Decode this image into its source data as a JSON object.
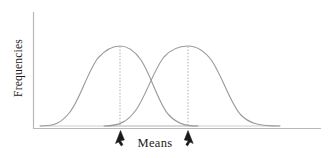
{
  "figure": {
    "title": "",
    "background_color": "#ffffff",
    "line_color": "#9a9a9a",
    "axis_color": "#b8b8b8",
    "text_color": "#1a1a1a",
    "arrow_color": "#1a1a1a"
  },
  "labels": {
    "y_axis": "Frequencies",
    "x_axis": "Means"
  },
  "chart_data": {
    "type": "line",
    "title": "",
    "xlabel": "Means",
    "ylabel": "Frequencies",
    "grid": false,
    "legend": false,
    "axis_ticks": [],
    "xlim": [
      0,
      1
    ],
    "ylim": [
      0,
      1
    ],
    "annotations": [
      {
        "kind": "dashed-vline",
        "at_series": "Distribution 1",
        "label": "mean 1"
      },
      {
        "kind": "dashed-vline",
        "at_series": "Distribution 2",
        "label": "mean 2"
      },
      {
        "kind": "arrow-up",
        "points_to": "mean 1"
      },
      {
        "kind": "arrow-up",
        "points_to": "mean 2"
      }
    ],
    "series": [
      {
        "name": "Distribution 1",
        "kind": "normal-curve",
        "mean": 0.305,
        "peak_height": 0.79,
        "path": "M 40,126 C 56,126 62,122 70,112 C 80,99 88,71 98,58 C 106,49 114,46 120,46 C 127,46 134,50 141,60 C 151,75 158,102 168,114 C 176,123 184,126 198,126"
      },
      {
        "name": "Distribution 2",
        "kind": "normal-curve",
        "mean": 0.545,
        "peak_height": 0.79,
        "path": "M 104,126 C 120,126 128,121 136,110 C 146,96 154,69 164,57 C 172,48 180,46 188,46 C 196,46 204,50 212,61 C 222,76 230,102 240,114 C 249,124 260,126 280,126"
      }
    ],
    "baselines": [
      {
        "name": "baseline-1",
        "x_start": 40,
        "x_end": 198
      },
      {
        "name": "baseline-2",
        "x_start": 104,
        "x_end": 280
      }
    ]
  }
}
